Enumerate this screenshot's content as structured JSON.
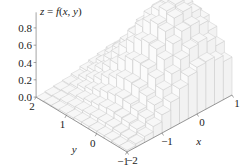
{
  "chart_data": {
    "type": "bar3d",
    "title": "z = f(x, y)",
    "xlabel": "x",
    "ylabel": "y",
    "zlabel": "z",
    "x_range": [
      -2,
      1
    ],
    "y_range": [
      -1,
      2
    ],
    "z_range": [
      0,
      0.9
    ],
    "cell_step": 0.25,
    "x_ticks": [
      {
        "value": -2,
        "label": "−2"
      },
      {
        "value": -1,
        "label": "−1"
      },
      {
        "value": 0,
        "label": "0"
      },
      {
        "value": 1,
        "label": "1"
      }
    ],
    "y_ticks": [
      {
        "value": 2,
        "label": "2"
      },
      {
        "value": 1,
        "label": "1"
      },
      {
        "value": 0,
        "label": "0"
      },
      {
        "value": -1,
        "label": "−1"
      }
    ],
    "z_ticks": [
      {
        "value": 0.0,
        "label": "0.0"
      },
      {
        "value": 0.2,
        "label": "0.2"
      },
      {
        "value": 0.4,
        "label": "0.4"
      },
      {
        "value": 0.6,
        "label": "0.6"
      },
      {
        "value": 0.8,
        "label": "0.8"
      }
    ],
    "x_centers": [
      -1.875,
      -1.625,
      -1.375,
      -1.125,
      -0.875,
      -0.625,
      -0.375,
      -0.125,
      0.125,
      0.375,
      0.625,
      0.875
    ],
    "y_centers": [
      -0.875,
      -0.625,
      -0.375,
      -0.125,
      0.125,
      0.375,
      0.625,
      0.875,
      1.125,
      1.375,
      1.625,
      1.875
    ],
    "z_values_rows_by_y": [
      [
        0.02,
        0.04,
        0.07,
        0.13,
        0.21,
        0.3,
        0.4,
        0.49,
        0.54,
        0.55,
        0.51,
        0.44
      ],
      [
        0.02,
        0.05,
        0.1,
        0.17,
        0.27,
        0.39,
        0.52,
        0.63,
        0.7,
        0.72,
        0.67,
        0.57
      ],
      [
        0.03,
        0.06,
        0.12,
        0.2,
        0.32,
        0.47,
        0.63,
        0.76,
        0.85,
        0.86,
        0.81,
        0.69
      ],
      [
        0.03,
        0.07,
        0.13,
        0.23,
        0.36,
        0.53,
        0.7,
        0.85,
        0.95,
        0.97,
        0.9,
        0.77
      ],
      [
        0.03,
        0.07,
        0.14,
        0.24,
        0.37,
        0.54,
        0.72,
        0.88,
        0.98,
        1.0,
        0.93,
        0.79
      ],
      [
        0.03,
        0.07,
        0.13,
        0.22,
        0.36,
        0.52,
        0.69,
        0.84,
        0.93,
        0.95,
        0.89,
        0.75
      ],
      [
        0.03,
        0.06,
        0.11,
        0.2,
        0.31,
        0.46,
        0.61,
        0.74,
        0.82,
        0.84,
        0.78,
        0.67
      ],
      [
        0.02,
        0.05,
        0.09,
        0.16,
        0.26,
        0.37,
        0.5,
        0.6,
        0.67,
        0.68,
        0.64,
        0.54
      ],
      [
        0.02,
        0.04,
        0.07,
        0.12,
        0.19,
        0.28,
        0.37,
        0.46,
        0.51,
        0.52,
        0.48,
        0.41
      ],
      [
        0.01,
        0.03,
        0.05,
        0.09,
        0.14,
        0.2,
        0.26,
        0.32,
        0.35,
        0.36,
        0.34,
        0.29
      ],
      [
        0.01,
        0.02,
        0.03,
        0.05,
        0.09,
        0.13,
        0.17,
        0.21,
        0.23,
        0.23,
        0.22,
        0.18
      ],
      [
        0.0,
        0.01,
        0.02,
        0.03,
        0.05,
        0.08,
        0.1,
        0.12,
        0.14,
        0.14,
        0.13,
        0.11
      ]
    ],
    "colors": {
      "bar_fill_top": "#f7f7f7",
      "bar_fill_side_x": "#fbfbfb",
      "bar_fill_side_y": "#f2f2f2",
      "bar_edge": "#c8c8c8",
      "axis": "#666666"
    },
    "grid": false,
    "legend": null
  },
  "labels": {
    "equation_lhs": "z",
    "equation_eq": " = ",
    "equation_f": "f",
    "equation_args": "x, y"
  }
}
